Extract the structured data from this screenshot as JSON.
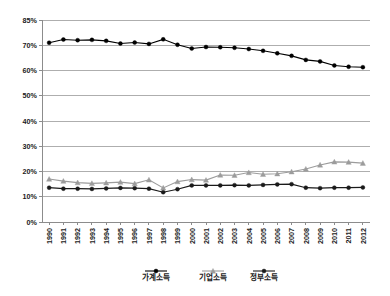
{
  "chart_data": {
    "type": "line",
    "title": "",
    "xlabel": "",
    "ylabel": "",
    "ylim": [
      0,
      85
    ],
    "grid": true,
    "legend_position": "bottom",
    "ytick_labels": [
      "85%",
      "70%",
      "60%",
      "50%",
      "40%",
      "30%",
      "20%",
      "10%",
      "0%"
    ],
    "ytick_values": [
      85,
      70,
      60,
      50,
      40,
      30,
      20,
      10,
      0
    ],
    "categories": [
      "1990",
      "1991",
      "1992",
      "1993",
      "1994",
      "1995",
      "1996",
      "1997",
      "1998",
      "1999",
      "2000",
      "2001",
      "2002",
      "2003",
      "2004",
      "2005",
      "2006",
      "2007",
      "2008",
      "2009",
      "2010",
      "2011",
      "2012"
    ],
    "series": [
      {
        "name": "가계소득",
        "color": "#000000",
        "marker": "circle",
        "values": [
          71.5,
          73.4,
          73.0,
          73.2,
          72.6,
          71.0,
          71.6,
          70.8,
          73.5,
          70.3,
          68.7,
          69.3,
          69.2,
          69.0,
          68.5,
          67.8,
          66.8,
          65.8,
          64.2,
          63.6,
          62.0,
          61.5,
          61.3
        ]
      },
      {
        "name": "기업소득",
        "color": "#9c9c9c",
        "marker": "triangle",
        "values": [
          17.0,
          16.2,
          15.6,
          15.3,
          15.5,
          15.8,
          15.2,
          16.7,
          13.5,
          16.0,
          16.8,
          16.6,
          18.6,
          18.5,
          19.6,
          18.9,
          19.1,
          19.9,
          21.0,
          22.6,
          23.8,
          23.7,
          23.3
        ]
      },
      {
        "name": "정부소득",
        "color": "#1a1a1a",
        "marker": "circle",
        "values": [
          13.6,
          13.2,
          13.2,
          13.1,
          13.3,
          13.5,
          13.4,
          13.2,
          11.8,
          13.0,
          14.5,
          14.5,
          14.5,
          14.6,
          14.5,
          14.7,
          14.9,
          15.0,
          13.6,
          13.4,
          13.6,
          13.6,
          13.7
        ]
      }
    ]
  }
}
